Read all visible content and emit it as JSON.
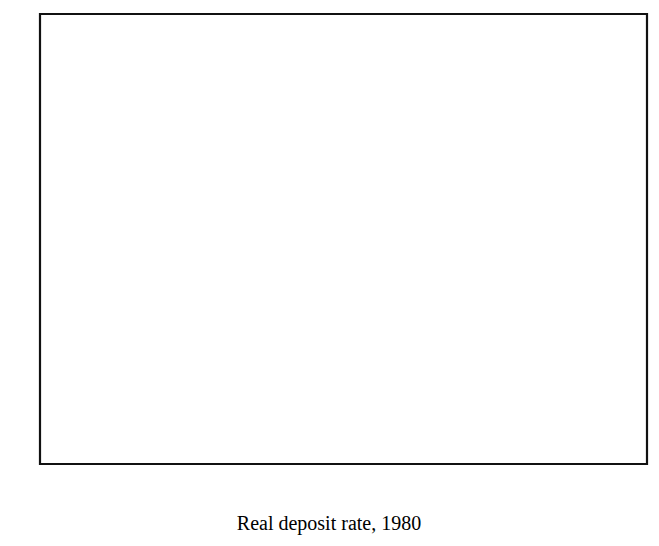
{
  "figure": {
    "background_color": "#ffffff",
    "ink_color": "#111111"
  },
  "chart_data": {
    "type": "scatter",
    "title": "",
    "xlabel": "Real deposit rate, 1980",
    "ylabel": "",
    "xlim": [
      -10,
      18
    ],
    "ylim": [
      -6,
      14
    ],
    "xticks": [
      -10,
      -6,
      -2,
      2,
      6,
      10,
      14,
      18
    ],
    "xtick_labels": [
      "-10",
      "-6",
      "-2",
      "2",
      "6",
      "10",
      "14",
      "18"
    ],
    "yticks": [
      -6,
      -2,
      2,
      6,
      10,
      14
    ],
    "ytick_labels": [
      "-6",
      "-2",
      "2",
      "6",
      "10",
      "14"
    ],
    "grid": false,
    "legend": null,
    "marker_style": "open-square",
    "points": [
      [
        -3.5,
        10.0
      ],
      [
        0.8,
        7.4
      ],
      [
        -5.8,
        5.7
      ],
      [
        -3.4,
        5.7
      ],
      [
        7.2,
        5.4
      ],
      [
        14.0,
        3.5
      ],
      [
        -4.4,
        3.6
      ],
      [
        -3.0,
        3.2
      ],
      [
        -2.3,
        3.2
      ],
      [
        -2.0,
        3.3
      ],
      [
        -6.5,
        2.6
      ],
      [
        -1.2,
        2.9
      ],
      [
        -1.0,
        2.8
      ],
      [
        8.6,
        2.7
      ],
      [
        9.3,
        2.4
      ],
      [
        -7.2,
        2.1
      ],
      [
        9.0,
        2.0
      ],
      [
        -6.1,
        1.9
      ],
      [
        -3.1,
        1.9
      ],
      [
        -2.8,
        1.6
      ],
      [
        -1.3,
        2.0
      ],
      [
        -1.4,
        1.5
      ],
      [
        3.3,
        1.9
      ],
      [
        3.9,
        1.6
      ],
      [
        -4.8,
        1.2
      ],
      [
        -4.6,
        0.9
      ],
      [
        0.4,
        1.0
      ],
      [
        1.0,
        0.9
      ],
      [
        7.6,
        1.1
      ],
      [
        8.7,
        1.1
      ],
      [
        2.2,
        0.9
      ],
      [
        -0.4,
        0.45
      ],
      [
        0.9,
        0.1
      ],
      [
        1.1,
        0.45
      ],
      [
        4.6,
        0.65
      ],
      [
        4.6,
        0.2
      ],
      [
        10.9,
        0.7
      ],
      [
        -9.6,
        -1.2
      ],
      [
        -8.2,
        -1.2
      ],
      [
        -5.8,
        -1.1
      ],
      [
        -5.8,
        -1.8
      ],
      [
        -3.4,
        -1.5
      ],
      [
        -3.5,
        -1.9
      ],
      [
        -2.6,
        -1.2
      ],
      [
        -2.3,
        -1.6
      ],
      [
        -1.3,
        -1.6
      ],
      [
        0.0,
        -1.6
      ],
      [
        0.5,
        -2.1
      ],
      [
        1.3,
        -1.9
      ],
      [
        2.6,
        -2.4
      ],
      [
        3.5,
        -2.5
      ],
      [
        5.2,
        -1.3
      ],
      [
        5.8,
        -1.3
      ],
      [
        5.6,
        -1.9
      ],
      [
        -9.6,
        -2.1
      ],
      [
        -1.6,
        -2.3
      ],
      [
        -0.9,
        -2.3
      ],
      [
        17.1,
        -2.5
      ],
      [
        -1.9,
        -3.1
      ],
      [
        -2.2,
        -4.0
      ],
      [
        -3.4,
        -5.0
      ],
      [
        9.4,
        -3.8
      ],
      [
        1.8,
        -5.3
      ],
      [
        -4.2,
        -5.8
      ],
      [
        -0.2,
        -5.8
      ],
      [
        -5.0,
        -5.6
      ]
    ],
    "trend_line": {
      "x_start": -10,
      "y_start": 0.45,
      "x_end": 18,
      "y_end": 1.35
    }
  }
}
